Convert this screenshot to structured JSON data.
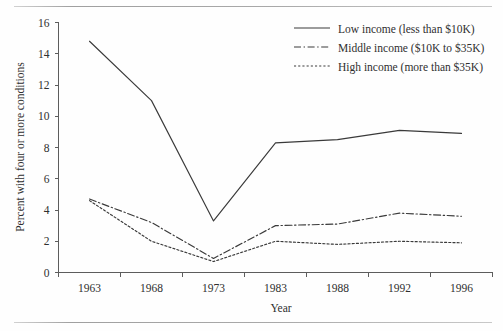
{
  "chart_data": {
    "type": "line",
    "title": "",
    "xlabel": "Year",
    "ylabel": "Percent with four or more conditions",
    "categories": [
      "1963",
      "1968",
      "1973",
      "1983",
      "1988",
      "1992",
      "1996"
    ],
    "ylim": [
      0,
      16
    ],
    "yticks": [
      0,
      2,
      4,
      6,
      8,
      10,
      12,
      14,
      16
    ],
    "grid": false,
    "legend_position": "top-right",
    "series": [
      {
        "name": "Low income (less than $10K)",
        "style": "solid",
        "values": [
          14.8,
          11.0,
          3.3,
          8.3,
          8.5,
          9.1,
          8.9
        ]
      },
      {
        "name": "Middle income ($10K to $35K)",
        "style": "dash-dot",
        "values": [
          4.7,
          3.2,
          0.9,
          3.0,
          3.1,
          3.8,
          3.6
        ]
      },
      {
        "name": "High income (more than $35K)",
        "style": "dotted",
        "values": [
          4.6,
          2.0,
          0.7,
          2.0,
          1.8,
          2.0,
          1.9
        ]
      }
    ]
  },
  "axes": {
    "y_tick_labels": [
      "16",
      "14",
      "12",
      "10",
      "8",
      "6",
      "4",
      "2",
      "0"
    ],
    "x_tick_labels": [
      "1963",
      "1968",
      "1973",
      "1983",
      "1988",
      "1992",
      "1996"
    ],
    "y_axis_title": "Percent with four or more conditions",
    "x_axis_title": "Year"
  },
  "legend": {
    "entries": [
      {
        "label": "Low income (less than $10K)",
        "style": "solid"
      },
      {
        "label": "Middle income ($10K to $35K)",
        "style": "dash-dot"
      },
      {
        "label": "High income (more than $35K)",
        "style": "dotted"
      }
    ]
  },
  "colors": {
    "line": "#3a3a3a",
    "axis": "#5d5d5d",
    "text": "#2f2f2f",
    "background": "#fefefe"
  }
}
